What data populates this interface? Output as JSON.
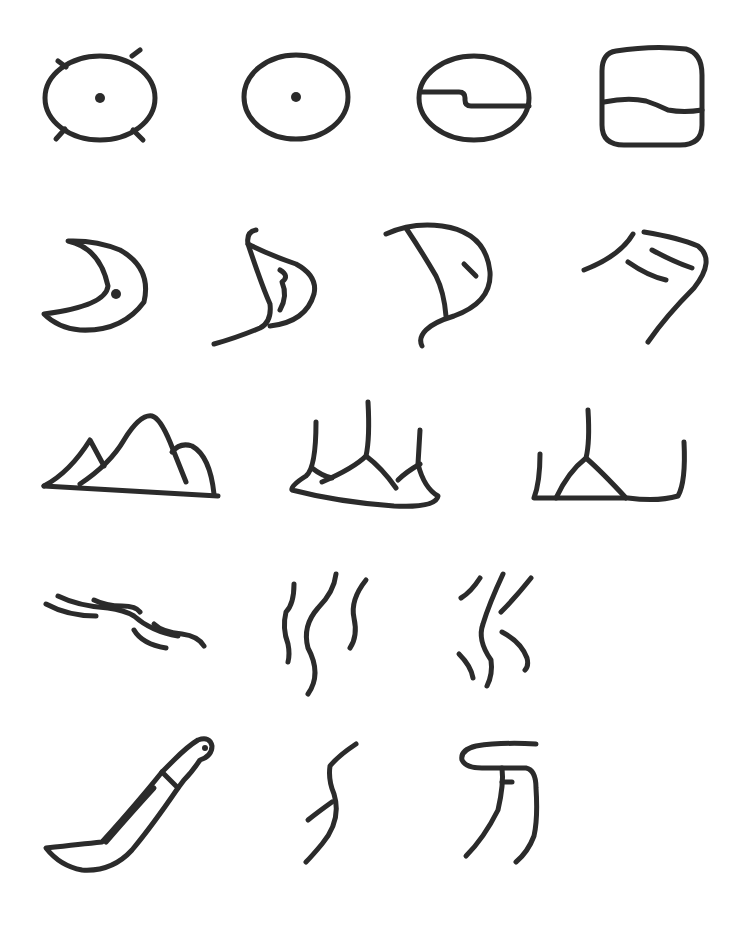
{
  "ink_color": "#2b2b2b",
  "background_color": "#ffffff",
  "rows": [
    {
      "theme": "sun",
      "glyphs": [
        "sun-rayed-icon",
        "sun-dot-icon",
        "sun-split-icon",
        "sun-square-icon"
      ]
    },
    {
      "theme": "moon",
      "glyphs": [
        "moon-dot-icon",
        "moon-curl-icon",
        "moon-sail-icon",
        "moon-stroke-icon"
      ]
    },
    {
      "theme": "mountain",
      "glyphs": [
        "mountain-peaks-icon",
        "mountain-three-spire-icon",
        "mountain-simple-icon"
      ]
    },
    {
      "theme": "water",
      "glyphs": [
        "water-horizontal-icon",
        "water-vertical-icon",
        "water-dashed-icon"
      ]
    },
    {
      "theme": "knife",
      "glyphs": [
        "knife-blade-icon",
        "knife-stroke-icon",
        "knife-script-icon"
      ]
    }
  ]
}
